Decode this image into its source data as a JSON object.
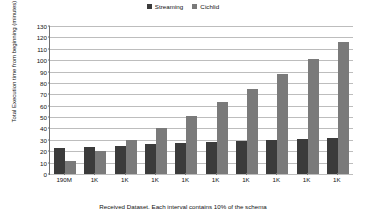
{
  "chart_data": {
    "type": "bar",
    "title": "",
    "xlabel": "Received Dataset. Each interval contains 10% of the schema",
    "ylabel": "Total Execution time from beginning (minutes)",
    "categories": [
      "190M",
      "1K",
      "1K",
      "1K",
      "1K",
      "1K",
      "1K",
      "1K",
      "1K",
      "1K"
    ],
    "series": [
      {
        "name": "Streaming",
        "color": "#3b3b3b",
        "values": [
          23,
          24,
          25,
          26,
          27,
          28,
          29,
          30,
          31,
          32
        ]
      },
      {
        "name": "Cichlid",
        "color": "#7a7a7a",
        "values": [
          11,
          20,
          30,
          40,
          51,
          63,
          75,
          88,
          101,
          116
        ]
      }
    ],
    "ylim": [
      0,
      130
    ],
    "yticks": [
      0,
      10,
      20,
      30,
      40,
      50,
      60,
      70,
      80,
      90,
      100,
      110,
      120,
      130
    ],
    "grid": true,
    "legend_position": "top-center"
  },
  "legend": {
    "entries": [
      {
        "label": "Streaming",
        "color": "#3b3b3b"
      },
      {
        "label": "Cichlid",
        "color": "#7a7a7a"
      }
    ]
  },
  "axes": {
    "y_title": "Total Execution time from beginning (minutes)",
    "x_title": "Received Dataset. Each interval contains 10% of the schema"
  }
}
